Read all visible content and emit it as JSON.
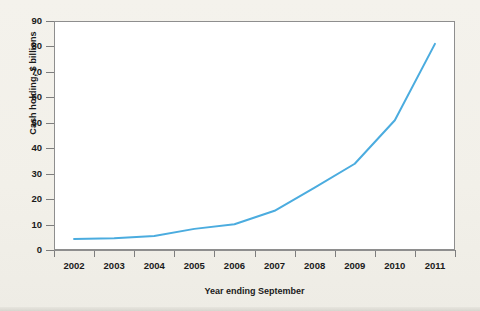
{
  "chart_data": {
    "type": "line",
    "title": "",
    "xlabel": "Year ending September",
    "ylabel": "Cash holding, $ billions",
    "categories": [
      "2002",
      "2003",
      "2004",
      "2005",
      "2006",
      "2007",
      "2008",
      "2009",
      "2010",
      "2011"
    ],
    "x": [
      2002,
      2003,
      2004,
      2005,
      2006,
      2007,
      2008,
      2009,
      2010,
      2011
    ],
    "values": [
      4.3,
      4.6,
      5.5,
      8.3,
      10.1,
      15.4,
      24.5,
      33.9,
      51.0,
      81.0
    ],
    "series": [
      {
        "name": "Cash holding",
        "color": "#4BACDF",
        "values": [
          4.3,
          4.6,
          5.5,
          8.3,
          10.1,
          15.4,
          24.5,
          33.9,
          51.0,
          81.0
        ]
      }
    ],
    "ylim": [
      0,
      90
    ],
    "yticks": [
      0,
      10,
      20,
      30,
      40,
      50,
      60,
      70,
      80,
      90
    ],
    "ytick_labels": [
      "0",
      "10",
      "20",
      "30",
      "40",
      "50",
      "60",
      "70",
      "80",
      "90"
    ],
    "xtick_labels": [
      "2002",
      "2003",
      "2004",
      "2005",
      "2006",
      "2007",
      "2008",
      "2009",
      "2010",
      "2011"
    ],
    "grid": false,
    "legend": "none",
    "line_color": "#4BACDF",
    "plot_background": "#ffffff",
    "figure_background": "#f2f0e9",
    "axis_color": "#8e8e8e",
    "text_color": "#1a1a1a"
  }
}
